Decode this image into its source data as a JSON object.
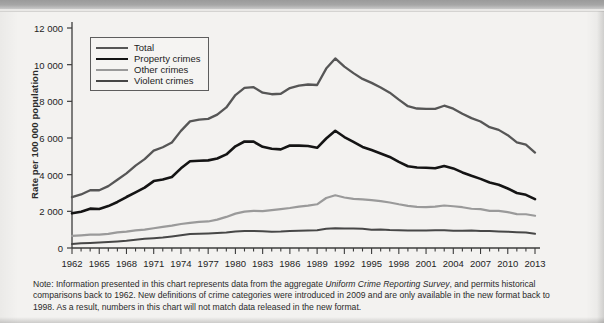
{
  "axis": {
    "y_title": "Rate per 100 000 population",
    "y_ticks": [
      "0",
      "2 000",
      "4 000",
      "6 000",
      "8 000",
      "10 000",
      "12 000"
    ],
    "x_ticks": [
      "1962",
      "1965",
      "1968",
      "1971",
      "1974",
      "1977",
      "1980",
      "1983",
      "1986",
      "1989",
      "1992",
      "1995",
      "1998",
      "2001",
      "2004",
      "2007",
      "2010",
      "2013"
    ]
  },
  "legend": {
    "items": [
      {
        "label": "Total",
        "color": "#565656",
        "width": 2.3
      },
      {
        "label": "Property crimes",
        "color": "#141414",
        "width": 2.6
      },
      {
        "label": "Other crimes",
        "color": "#9a9a9a",
        "width": 2.2
      },
      {
        "label": "Violent crimes",
        "color": "#474747",
        "width": 2.0
      }
    ]
  },
  "note": {
    "part1": "Note: Information presented in this chart represents data from the aggregate ",
    "italic": "Uniform Crime Reporting Survey",
    "part2": ", and permits historical comparisons back to 1962. New definitions of crime categories were introduced in 2009 and are only available in the new format back to 1998. As a result, numbers in this chart will not match data released in the new format."
  },
  "chart_data": {
    "type": "line",
    "title": "",
    "xlabel": "",
    "ylabel": "Rate per 100 000 population",
    "xlim": [
      1962,
      2013
    ],
    "ylim": [
      0,
      12000
    ],
    "ytick_step": 2000,
    "xtick_step": 3,
    "grid": false,
    "legend_position": "top-left",
    "x": [
      1962,
      1963,
      1964,
      1965,
      1966,
      1967,
      1968,
      1969,
      1970,
      1971,
      1972,
      1973,
      1974,
      1975,
      1976,
      1977,
      1978,
      1979,
      1980,
      1981,
      1982,
      1983,
      1984,
      1985,
      1986,
      1987,
      1988,
      1989,
      1990,
      1991,
      1992,
      1993,
      1994,
      1995,
      1996,
      1997,
      1998,
      1999,
      2000,
      2001,
      2002,
      2003,
      2004,
      2005,
      2006,
      2007,
      2008,
      2009,
      2010,
      2011,
      2012,
      2013
    ],
    "series": [
      {
        "name": "Total",
        "color": "#565656",
        "values": [
          2771,
          2922,
          3152,
          3150,
          3377,
          3720,
          4071,
          4495,
          4845,
          5312,
          5497,
          5758,
          6388,
          6905,
          7001,
          7044,
          7276,
          7666,
          8343,
          8736,
          8773,
          8470,
          8387,
          8413,
          8726,
          8858,
          8919,
          8892,
          9785,
          10342,
          9891,
          9538,
          9223,
          9007,
          8752,
          8472,
          8092,
          7733,
          7608,
          7590,
          7590,
          7761,
          7602,
          7325,
          7083,
          6902,
          6588,
          6443,
          6155,
          5757,
          5633,
          5206
        ]
      },
      {
        "name": "Property crimes",
        "color": "#141414",
        "values": [
          1891,
          1979,
          2146,
          2125,
          2285,
          2512,
          2780,
          3031,
          3291,
          3650,
          3735,
          3872,
          4346,
          4729,
          4762,
          4780,
          4884,
          5104,
          5546,
          5808,
          5800,
          5518,
          5416,
          5380,
          5588,
          5586,
          5560,
          5466,
          5971,
          6393,
          6052,
          5785,
          5510,
          5341,
          5159,
          4966,
          4695,
          4462,
          4390,
          4381,
          4350,
          4470,
          4342,
          4122,
          3939,
          3771,
          3569,
          3453,
          3245,
          3000,
          2900,
          2668
        ]
      },
      {
        "name": "Other crimes",
        "color": "#9a9a9a",
        "values": [
          659,
          689,
          727,
          728,
          768,
          850,
          892,
          958,
          1003,
          1078,
          1153,
          1217,
          1309,
          1373,
          1420,
          1447,
          1549,
          1696,
          1874,
          1986,
          2024,
          2015,
          2068,
          2119,
          2181,
          2255,
          2312,
          2385,
          2727,
          2876,
          2756,
          2676,
          2648,
          2608,
          2552,
          2482,
          2385,
          2301,
          2248,
          2233,
          2259,
          2319,
          2276,
          2225,
          2142,
          2120,
          2029,
          2027,
          1955,
          1847,
          1840,
          1761
        ]
      },
      {
        "name": "Violent crimes",
        "color": "#474747",
        "values": [
          221,
          254,
          279,
          297,
          324,
          358,
          399,
          456,
          501,
          534,
          569,
          629,
          693,
          763,
          779,
          797,
          823,
          846,
          899,
          928,
          927,
          917,
          893,
          894,
          927,
          947,
          958,
          963,
          1046,
          1071,
          1069,
          1059,
          1047,
          1002,
          1007,
          982,
          974,
          957,
          956,
          960,
          966,
          969,
          947,
          943,
          951,
          930,
          921,
          904,
          885,
          864,
          843,
          777
        ]
      }
    ]
  }
}
